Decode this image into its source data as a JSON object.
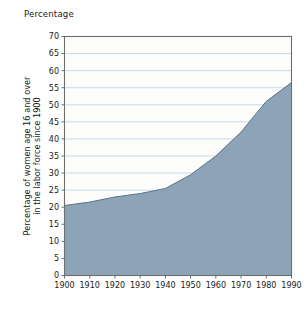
{
  "chart_data": {
    "type": "area",
    "title": "Percentage",
    "xlabel": "",
    "ylabel": "Percentage of women age 16 and over in the labor force since 1900",
    "ylabel_lines": [
      "Percentage of women age 16 and over",
      "in the labor force since 1900"
    ],
    "categories": [
      1900,
      1910,
      1920,
      1930,
      1940,
      1950,
      1960,
      1970,
      1980,
      1990
    ],
    "values": [
      20.5,
      21.5,
      23.0,
      24.0,
      25.5,
      29.5,
      35.0,
      42.0,
      51.0,
      56.5
    ],
    "x": [
      1900,
      1910,
      1920,
      1930,
      1940,
      1950,
      1960,
      1970,
      1980,
      1990
    ],
    "xlim": [
      1900,
      1990
    ],
    "ylim": [
      0,
      70
    ],
    "xticks": [
      1900,
      1910,
      1920,
      1930,
      1940,
      1950,
      1960,
      1970,
      1980,
      1990
    ],
    "xtick_labels": [
      "1900",
      "1910",
      "1920",
      "1930",
      "1940",
      "1950",
      "1960",
      "1970",
      "1980",
      "1990"
    ],
    "yticks": [
      0,
      5,
      10,
      15,
      20,
      25,
      30,
      35,
      40,
      45,
      50,
      55,
      60,
      65,
      70
    ],
    "ytick_labels": [
      "0",
      "5",
      "10",
      "15",
      "20",
      "25",
      "30",
      "35",
      "40",
      "45",
      "50",
      "55",
      "60",
      "65",
      "70"
    ],
    "grid": true,
    "grid_axis": "y",
    "legend": false,
    "legend_position": "none",
    "series": [
      {
        "name": "Percentage of women age 16 and over in the labor force",
        "values": [
          20.5,
          21.5,
          23.0,
          24.0,
          25.5,
          29.5,
          35.0,
          42.0,
          51.0,
          56.5
        ]
      }
    ]
  },
  "colors": {
    "area_fill": "#8ca3b8",
    "area_edge": "#5c7287",
    "gridline": "#b9d0e8",
    "axis": "#6e6e6e",
    "plot_background": "#fdfdfb",
    "text": "#1a1a1a",
    "page_background": "#ffffff"
  }
}
